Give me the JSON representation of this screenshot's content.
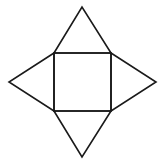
{
  "diagram": {
    "type": "square pyramid net",
    "stroke_color": "#1a1a1a",
    "background": "#ffffff",
    "square": {
      "points": "54,53 111,53 111,111 54,111"
    },
    "triangles": [
      {
        "name": "top",
        "points": "54,53 82,7 111,53"
      },
      {
        "name": "right",
        "points": "111,53 156,82 111,111"
      },
      {
        "name": "bottom",
        "points": "54,111 82,157 111,111"
      },
      {
        "name": "left",
        "points": "54,53 9,82 54,111"
      }
    ]
  }
}
